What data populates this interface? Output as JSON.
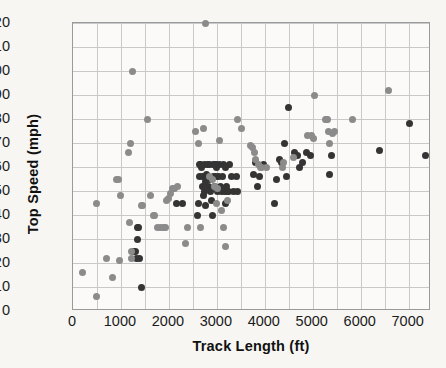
{
  "chart_data": {
    "type": "scatter",
    "title": "",
    "xlabel": "Track Length (ft)",
    "ylabel": "Top Speed (mph)",
    "xlim": [
      0,
      7466
    ],
    "ylim": [
      0,
      120
    ],
    "xticks": [
      0,
      1000,
      2000,
      3000,
      4000,
      5000,
      6000,
      7000
    ],
    "xtick_labels": [
      "0",
      "1000",
      "2000",
      "3000",
      "4000",
      "5000",
      "6000",
      "7000"
    ],
    "yticks": [
      0,
      10,
      20,
      30,
      40,
      50,
      60,
      70,
      80,
      90,
      100,
      110,
      120
    ],
    "ytick_labels": [
      "0",
      "10",
      "20",
      "30",
      "40",
      "50",
      "60",
      "70",
      "80",
      "90",
      "100",
      "110",
      "120"
    ],
    "x_minor_gridline_step": 500,
    "y_gridline_step": 10,
    "grid": true,
    "legend": "none",
    "colors": {
      "series_dark": "#343434",
      "series_gray": "#8b8b8b",
      "gridline": "#c9c9c9",
      "axis": "#9a9a9a",
      "background": "#f8f6f3",
      "plot_background": "#fbfaf8",
      "text": "#111111"
    },
    "series": [
      {
        "name": "dark-markers",
        "color": "#343434",
        "marker": "circle",
        "points": [
          [
            1340,
            35
          ],
          [
            1360,
            35
          ],
          [
            1345,
            30
          ],
          [
            1300,
            25
          ],
          [
            1270,
            25
          ],
          [
            1430,
            10
          ],
          [
            1395,
            22
          ],
          [
            1320,
            22
          ],
          [
            2150,
            45
          ],
          [
            2290,
            45
          ],
          [
            2600,
            40
          ],
          [
            2610,
            45
          ],
          [
            2640,
            56
          ],
          [
            2660,
            61
          ],
          [
            2680,
            60
          ],
          [
            2700,
            52
          ],
          [
            2710,
            56
          ],
          [
            2720,
            48
          ],
          [
            2740,
            61
          ],
          [
            2750,
            50
          ],
          [
            2760,
            44
          ],
          [
            2770,
            54
          ],
          [
            2790,
            57
          ],
          [
            2800,
            61
          ],
          [
            2820,
            52
          ],
          [
            2840,
            61
          ],
          [
            2850,
            55
          ],
          [
            2860,
            50
          ],
          [
            2880,
            46
          ],
          [
            2900,
            40
          ],
          [
            2920,
            56
          ],
          [
            2940,
            61
          ],
          [
            2960,
            52
          ],
          [
            2980,
            56
          ],
          [
            3000,
            61
          ],
          [
            3020,
            50
          ],
          [
            3040,
            56
          ],
          [
            3060,
            61
          ],
          [
            3080,
            52
          ],
          [
            3100,
            50
          ],
          [
            3120,
            56
          ],
          [
            3140,
            61
          ],
          [
            3160,
            50
          ],
          [
            3180,
            45
          ],
          [
            3200,
            52
          ],
          [
            3220,
            50
          ],
          [
            3240,
            50
          ],
          [
            3260,
            61
          ],
          [
            3300,
            56
          ],
          [
            3340,
            50
          ],
          [
            3400,
            56
          ],
          [
            3440,
            50
          ],
          [
            3760,
            57
          ],
          [
            3800,
            62
          ],
          [
            3840,
            52
          ],
          [
            3880,
            56
          ],
          [
            3980,
            61
          ],
          [
            4200,
            45
          ],
          [
            4250,
            55
          ],
          [
            4300,
            63
          ],
          [
            4340,
            62
          ],
          [
            4420,
            70
          ],
          [
            4460,
            56
          ],
          [
            4500,
            85
          ],
          [
            4620,
            66
          ],
          [
            4680,
            65
          ],
          [
            4720,
            60
          ],
          [
            4780,
            62
          ],
          [
            4880,
            66
          ],
          [
            4960,
            65
          ],
          [
            5340,
            57
          ],
          [
            5400,
            65
          ],
          [
            6400,
            67
          ],
          [
            7010,
            78
          ],
          [
            7350,
            65
          ],
          [
            2640,
            61
          ],
          [
            3000,
            60
          ],
          [
            3180,
            60
          ],
          [
            2960,
            61
          ]
        ]
      },
      {
        "name": "gray-markers",
        "color": "#8b8b8b",
        "marker": "circle",
        "points": [
          [
            200,
            16
          ],
          [
            480,
            6
          ],
          [
            490,
            45
          ],
          [
            700,
            22
          ],
          [
            820,
            14
          ],
          [
            900,
            55
          ],
          [
            940,
            55
          ],
          [
            960,
            21
          ],
          [
            1000,
            48
          ],
          [
            1160,
            66
          ],
          [
            1180,
            37
          ],
          [
            1200,
            70
          ],
          [
            1220,
            25
          ],
          [
            1230,
            22
          ],
          [
            1250,
            100
          ],
          [
            1420,
            44
          ],
          [
            1440,
            44
          ],
          [
            1560,
            80
          ],
          [
            1620,
            48
          ],
          [
            1680,
            40
          ],
          [
            1700,
            40
          ],
          [
            1760,
            35
          ],
          [
            1820,
            35
          ],
          [
            1880,
            35
          ],
          [
            1920,
            35
          ],
          [
            1960,
            46
          ],
          [
            2000,
            47
          ],
          [
            2040,
            49
          ],
          [
            2080,
            51
          ],
          [
            2100,
            51
          ],
          [
            2120,
            51
          ],
          [
            2180,
            52
          ],
          [
            2340,
            28
          ],
          [
            2380,
            35
          ],
          [
            2560,
            75
          ],
          [
            2620,
            70
          ],
          [
            2660,
            35
          ],
          [
            2720,
            76
          ],
          [
            2760,
            120
          ],
          [
            2900,
            55
          ],
          [
            2960,
            52
          ],
          [
            3000,
            45
          ],
          [
            3060,
            71
          ],
          [
            3100,
            42
          ],
          [
            3140,
            35
          ],
          [
            3180,
            27
          ],
          [
            3440,
            80
          ],
          [
            3520,
            76
          ],
          [
            3700,
            69
          ],
          [
            3740,
            68
          ],
          [
            3780,
            66
          ],
          [
            3800,
            63
          ],
          [
            3860,
            61
          ],
          [
            3900,
            60
          ],
          [
            3940,
            60
          ],
          [
            4040,
            60
          ],
          [
            4360,
            60
          ],
          [
            4400,
            62
          ],
          [
            4600,
            64
          ],
          [
            4900,
            73
          ],
          [
            4980,
            73
          ],
          [
            5020,
            72
          ],
          [
            5040,
            90
          ],
          [
            5260,
            80
          ],
          [
            5280,
            80
          ],
          [
            5300,
            80
          ],
          [
            5320,
            75
          ],
          [
            5340,
            70
          ],
          [
            5420,
            74
          ],
          [
            5460,
            75
          ],
          [
            5820,
            80
          ],
          [
            6580,
            92
          ],
          [
            2840,
            56
          ],
          [
            3020,
            51
          ],
          [
            3220,
            46
          ]
        ]
      }
    ]
  }
}
